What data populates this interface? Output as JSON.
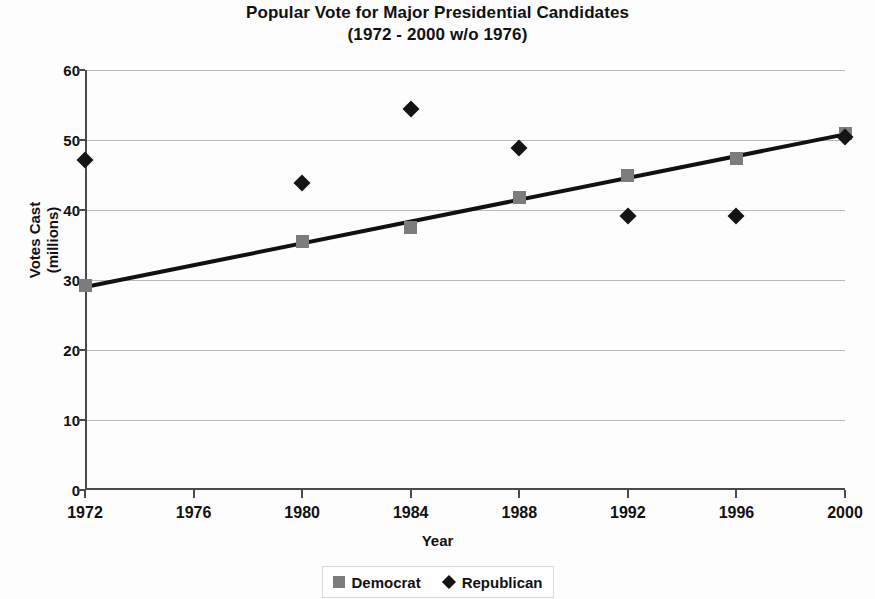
{
  "chart_data": {
    "type": "scatter",
    "title": "Popular Vote for Major Presidential Candidates",
    "subtitle": "(1972 - 2000 w/o 1976)",
    "xlabel": "Year",
    "ylabel": "Votes Cast\n(millions)",
    "ylabel_line1": "Votes Cast",
    "ylabel_line2": "(millions)",
    "x": [
      1972,
      1980,
      1984,
      1988,
      1992,
      1996,
      2000
    ],
    "categories": [
      "1972",
      "1976",
      "1980",
      "1984",
      "1988",
      "1992",
      "1996",
      "2000"
    ],
    "xticks": [
      "1972",
      "1976",
      "1980",
      "1984",
      "1988",
      "1992",
      "1996",
      "2000"
    ],
    "yticks": [
      "0",
      "10",
      "20",
      "30",
      "40",
      "50",
      "60"
    ],
    "xlim": [
      1972,
      2000
    ],
    "ylim": [
      0,
      60
    ],
    "grid": true,
    "legend_position": "bottom",
    "series": [
      {
        "name": "Democrat",
        "marker": "square",
        "color": "#7c7c7c",
        "points": [
          {
            "x": 1972,
            "y": 29.2
          },
          {
            "x": 1980,
            "y": 35.5
          },
          {
            "x": 1984,
            "y": 37.5
          },
          {
            "x": 1988,
            "y": 41.8
          },
          {
            "x": 1992,
            "y": 44.9
          },
          {
            "x": 1996,
            "y": 47.4
          },
          {
            "x": 2000,
            "y": 51.0
          }
        ]
      },
      {
        "name": "Republican",
        "marker": "diamond",
        "color": "#141414",
        "points": [
          {
            "x": 1972,
            "y": 47.2
          },
          {
            "x": 1980,
            "y": 43.9
          },
          {
            "x": 1984,
            "y": 54.5
          },
          {
            "x": 1988,
            "y": 48.9
          },
          {
            "x": 1992,
            "y": 39.1
          },
          {
            "x": 1996,
            "y": 39.2
          },
          {
            "x": 2000,
            "y": 50.5
          }
        ]
      }
    ],
    "trendline": {
      "name": "Democrat trend",
      "color": "#111111",
      "x_start": 1972,
      "y_start": 29.0,
      "x_end": 2000,
      "y_end": 50.8
    },
    "legend": [
      {
        "label": "Democrat",
        "marker": "square",
        "color": "#7c7c7c"
      },
      {
        "label": "Republican",
        "marker": "diamond",
        "color": "#141414"
      }
    ]
  }
}
